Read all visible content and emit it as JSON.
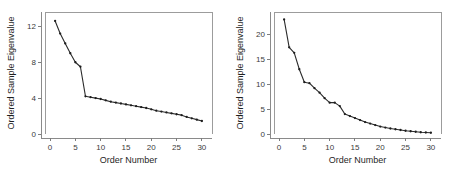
{
  "figure": {
    "background_color": "#ffffff",
    "line_color": "#2b2b2b",
    "axis_color": "#8a8a8a",
    "text_color": "#1f1f1f",
    "panel_count": 2
  },
  "chart_data": [
    {
      "id": "scree-plot-left",
      "type": "line",
      "title": "",
      "xlabel": "Order Number",
      "ylabel": "Ordered Sample Eigenvalue",
      "xlim": [
        -1,
        32
      ],
      "ylim": [
        0,
        13.6
      ],
      "xticks": [
        0,
        5,
        10,
        15,
        20,
        25,
        30
      ],
      "xticklabels": [
        "0",
        "5",
        "10",
        "15",
        "20",
        "25",
        "30"
      ],
      "yticks": [
        0,
        4,
        8,
        12
      ],
      "yticklabels": [
        "0",
        "4",
        "8",
        "12"
      ],
      "grid": false,
      "legend": null,
      "markers": true,
      "x": [
        1,
        2,
        3,
        4,
        5,
        6,
        7,
        8,
        9,
        10,
        11,
        12,
        13,
        14,
        15,
        16,
        17,
        18,
        19,
        20,
        21,
        22,
        23,
        24,
        25,
        26,
        27,
        28,
        29,
        30
      ],
      "values": [
        12.6,
        11.2,
        10.1,
        9.0,
        8.0,
        7.5,
        4.2,
        4.1,
        4.0,
        3.9,
        3.75,
        3.6,
        3.5,
        3.4,
        3.3,
        3.2,
        3.1,
        3.0,
        2.9,
        2.75,
        2.6,
        2.5,
        2.4,
        2.3,
        2.2,
        2.1,
        1.9,
        1.75,
        1.6,
        1.45
      ]
    },
    {
      "id": "scree-plot-right",
      "type": "line",
      "title": "",
      "xlabel": "Order Number",
      "ylabel": "Ordered Sample Eigenvalue",
      "xlim": [
        -1,
        32
      ],
      "ylim": [
        0,
        24.5
      ],
      "xticks": [
        0,
        5,
        10,
        15,
        20,
        25,
        30
      ],
      "xticklabels": [
        "0",
        "5",
        "10",
        "15",
        "20",
        "25",
        "30"
      ],
      "yticks": [
        0,
        5,
        10,
        15,
        20
      ],
      "yticklabels": [
        "0",
        "5",
        "10",
        "15",
        "20"
      ],
      "grid": false,
      "legend": null,
      "markers": true,
      "x": [
        1,
        2,
        3,
        4,
        5,
        6,
        7,
        8,
        9,
        10,
        11,
        12,
        13,
        14,
        15,
        16,
        17,
        18,
        19,
        20,
        21,
        22,
        23,
        24,
        25,
        26,
        27,
        28,
        29,
        30
      ],
      "values": [
        23.0,
        17.4,
        16.3,
        13.0,
        10.4,
        10.2,
        9.2,
        8.3,
        7.2,
        6.3,
        6.3,
        5.6,
        4.0,
        3.6,
        3.2,
        2.8,
        2.4,
        2.1,
        1.8,
        1.5,
        1.3,
        1.1,
        0.95,
        0.8,
        0.65,
        0.55,
        0.45,
        0.35,
        0.3,
        0.25
      ]
    }
  ]
}
